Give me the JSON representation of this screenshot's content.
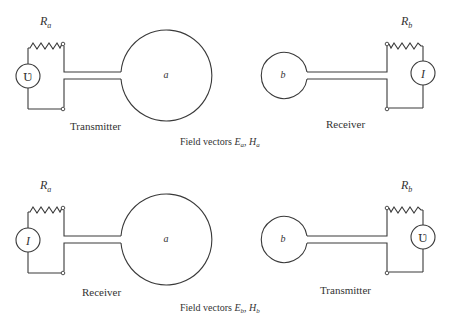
{
  "panels": [
    {
      "id": "top",
      "left_source": {
        "symbol": "Ʋ",
        "resistor": "R",
        "resistor_sub": "a",
        "role": "Transmitter"
      },
      "left_antenna": "a",
      "right_antenna": "b",
      "right_source": {
        "symbol": "I",
        "resistor": "R",
        "resistor_sub": "b",
        "role": "Receiver"
      },
      "caption": {
        "prefix": "Field vectors ",
        "e": "E",
        "e_sub": "a",
        "sep": ", ",
        "h": "H",
        "h_sub": "a"
      }
    },
    {
      "id": "bottom",
      "left_source": {
        "symbol": "I",
        "resistor": "R",
        "resistor_sub": "a",
        "role": "Receiver"
      },
      "left_antenna": "a",
      "right_antenna": "b",
      "right_source": {
        "symbol": "Ʋ",
        "resistor": "R",
        "resistor_sub": "b",
        "role": "Transmitter"
      },
      "caption": {
        "prefix": "Field vectors ",
        "e": "E",
        "e_sub": "b",
        "sep": ", ",
        "h": "H",
        "h_sub": "b"
      }
    }
  ]
}
